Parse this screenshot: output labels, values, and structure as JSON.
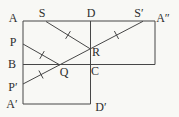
{
  "diagram": {
    "width": 179,
    "height": 117,
    "colors": {
      "background": "#f8f8f5",
      "stroke": "#474747",
      "label": "#2e2e2e"
    },
    "edges": [
      {
        "name": "top-edge",
        "x1": 23,
        "y1": 21,
        "x2": 155,
        "y2": 21
      },
      {
        "name": "left-edge",
        "x1": 23,
        "y1": 21,
        "x2": 23,
        "y2": 104
      },
      {
        "name": "right-edge",
        "x1": 155,
        "y1": 21,
        "x2": 155,
        "y2": 64.5
      },
      {
        "name": "middle-horizontal-edge",
        "x1": 23,
        "y1": 64.5,
        "x2": 155,
        "y2": 64.5
      },
      {
        "name": "center-vertical-edge",
        "x1": 90.5,
        "y1": 21,
        "x2": 90.5,
        "y2": 104
      },
      {
        "name": "bottom-edge",
        "x1": 23,
        "y1": 104,
        "x2": 90.5,
        "y2": 104
      }
    ],
    "fold_lines": [
      {
        "name": "fold-line-S-R",
        "x1": 46,
        "y1": 21.5,
        "x2": 90.5,
        "y2": 49
      },
      {
        "name": "fold-line-P-Q",
        "x1": 23,
        "y1": 44,
        "x2": 60,
        "y2": 65
      },
      {
        "name": "fold-line-Pprime-Q-R-Sprime",
        "x1": 23,
        "y1": 84,
        "x2": 143,
        "y2": 21.3
      }
    ],
    "tick_marks": [
      {
        "name": "tick-on-S-R",
        "x": 68,
        "y": 35,
        "angle": -58,
        "length": 9
      },
      {
        "name": "tick-on-P-Q",
        "x": 42,
        "y": 55,
        "angle": -60,
        "length": 9
      },
      {
        "name": "tick-on-Pprime-Q",
        "x": 41,
        "y": 74.5,
        "angle": 62,
        "length": 9
      },
      {
        "name": "tick-on-R-Sprime",
        "x": 116.5,
        "y": 35,
        "angle": 62,
        "length": 9
      }
    ],
    "labels": [
      {
        "name": "label-A",
        "text": "A",
        "x": 13,
        "y": 18
      },
      {
        "name": "label-S",
        "text": "S",
        "x": 42,
        "y": 13
      },
      {
        "name": "label-D",
        "text": "D",
        "x": 91,
        "y": 13
      },
      {
        "name": "label-S-prime",
        "text": "S′",
        "x": 139,
        "y": 13
      },
      {
        "name": "label-A-double-prime",
        "text": "A″",
        "x": 163,
        "y": 18
      },
      {
        "name": "label-P",
        "text": "P",
        "x": 13,
        "y": 42
      },
      {
        "name": "label-R",
        "text": "R",
        "x": 96,
        "y": 52
      },
      {
        "name": "label-B",
        "text": "B",
        "x": 12,
        "y": 64
      },
      {
        "name": "label-Q",
        "text": "Q",
        "x": 64,
        "y": 72
      },
      {
        "name": "label-C",
        "text": "C",
        "x": 95,
        "y": 71
      },
      {
        "name": "label-P-prime",
        "text": "P′",
        "x": 13,
        "y": 87
      },
      {
        "name": "label-A-prime",
        "text": "A′",
        "x": 12,
        "y": 104
      },
      {
        "name": "label-D-prime",
        "text": "D′",
        "x": 101,
        "y": 107
      }
    ]
  }
}
